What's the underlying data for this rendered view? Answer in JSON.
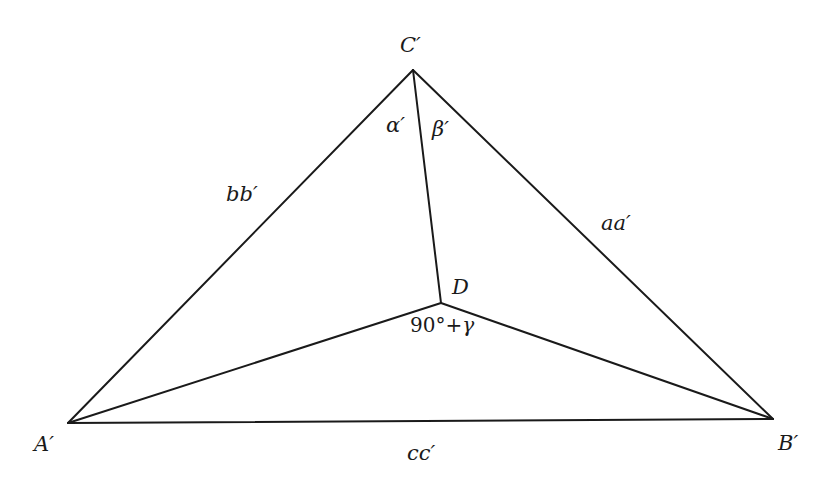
{
  "diagram": {
    "type": "geometric-triangle",
    "vertices": {
      "A": {
        "label": "A′",
        "x": 68,
        "y": 423
      },
      "B": {
        "label": "B′",
        "x": 773,
        "y": 419
      },
      "C": {
        "label": "C′",
        "x": 413,
        "y": 70
      },
      "D": {
        "label": "D",
        "x": 441,
        "y": 303
      }
    },
    "sides": {
      "CA": {
        "label": "bb′"
      },
      "CB": {
        "label": "aa′"
      },
      "AB": {
        "label": "cc′"
      }
    },
    "angles": {
      "alpha": {
        "label": "α′"
      },
      "beta": {
        "label": "β′"
      },
      "angle_at_D": {
        "label": "90°+γ"
      }
    },
    "colors": {
      "stroke": "#1a1a1a",
      "background": "#ffffff"
    }
  }
}
